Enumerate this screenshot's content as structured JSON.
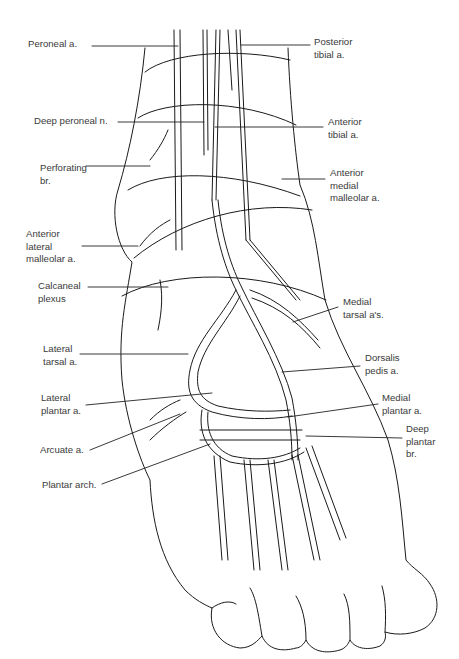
{
  "diagram": {
    "labels_left": [
      {
        "id": "peroneal-a",
        "text": "Peroneal a.",
        "x": 28,
        "y": 38
      },
      {
        "id": "deep-peroneal-n",
        "text": "Deep peroneal n.",
        "x": 34,
        "y": 115
      },
      {
        "id": "perforating-br",
        "text": "Perforating\nbr.",
        "x": 40,
        "y": 162
      },
      {
        "id": "anterior-lateral-malleolar-a",
        "text": "Anterior\nlateral\nmalleolar a.",
        "x": 26,
        "y": 228
      },
      {
        "id": "calcaneal-plexus",
        "text": "Calcaneal\nplexus",
        "x": 38,
        "y": 280
      },
      {
        "id": "lateral-tarsal-a",
        "text": "Lateral\ntarsal a.",
        "x": 43,
        "y": 343
      },
      {
        "id": "lateral-plantar-a",
        "text": "Lateral\nplantar a.",
        "x": 41,
        "y": 392
      },
      {
        "id": "arcuate-a",
        "text": "Arcuate a.",
        "x": 40,
        "y": 444
      },
      {
        "id": "plantar-arch",
        "text": "Plantar arch.",
        "x": 42,
        "y": 479
      }
    ],
    "labels_right": [
      {
        "id": "posterior-tibial-a",
        "text": "Posterior\ntibial a.",
        "x": 314,
        "y": 36
      },
      {
        "id": "anterior-tibial-a",
        "text": "Anterior\ntibial a.",
        "x": 328,
        "y": 116
      },
      {
        "id": "anterior-medial-malleolar-a",
        "text": "Anterior\nmedial\nmalleolar a.",
        "x": 330,
        "y": 167
      },
      {
        "id": "medial-tarsal-as",
        "text": "Medial\ntarsal a's.",
        "x": 343,
        "y": 296
      },
      {
        "id": "dorsalis-pedis-a",
        "text": "Dorsalis\npedis a.",
        "x": 365,
        "y": 352
      },
      {
        "id": "medial-plantar-a",
        "text": "Medial\nplantar a.",
        "x": 382,
        "y": 392
      },
      {
        "id": "deep-plantar-br",
        "text": "Deep\nplantar\nbr.",
        "x": 406,
        "y": 423
      }
    ],
    "leaders": [
      {
        "for": "peroneal-a",
        "x1": 92,
        "y1": 46,
        "x2": 178,
        "y2": 46
      },
      {
        "for": "posterior-tibial-a",
        "x1": 241,
        "y1": 45,
        "x2": 310,
        "y2": 45
      },
      {
        "for": "deep-peroneal-n",
        "x1": 118,
        "y1": 122,
        "x2": 204,
        "y2": 122
      },
      {
        "for": "anterior-tibial-a",
        "x1": 215,
        "y1": 127,
        "x2": 323,
        "y2": 127
      },
      {
        "for": "perforating-br",
        "x1": 86,
        "y1": 166,
        "x2": 150,
        "y2": 166
      },
      {
        "for": "anterior-medial-malleolar-a",
        "x1": 282,
        "y1": 179,
        "x2": 325,
        "y2": 179
      },
      {
        "for": "anterior-lateral-malleolar-a",
        "x1": 82,
        "y1": 246,
        "x2": 138,
        "y2": 246
      },
      {
        "for": "calcaneal-plexus",
        "x1": 88,
        "y1": 287,
        "x2": 168,
        "y2": 287
      },
      {
        "for": "medial-tarsal-as",
        "x1": 293,
        "y1": 322,
        "x2": 338,
        "y2": 307
      },
      {
        "for": "lateral-tarsal-a",
        "x1": 80,
        "y1": 354,
        "x2": 188,
        "y2": 354
      },
      {
        "for": "dorsalis-pedis-a",
        "x1": 282,
        "y1": 372,
        "x2": 360,
        "y2": 366
      },
      {
        "for": "lateral-plantar-a",
        "x1": 86,
        "y1": 405,
        "x2": 212,
        "y2": 393
      },
      {
        "for": "medial-plantar-a",
        "x1": 288,
        "y1": 417,
        "x2": 378,
        "y2": 404
      },
      {
        "for": "deep-plantar-br",
        "x1": 306,
        "y1": 436,
        "x2": 402,
        "y2": 438
      },
      {
        "for": "arcuate-a",
        "x1": 90,
        "y1": 450,
        "x2": 180,
        "y2": 414
      },
      {
        "for": "plantar-arch",
        "x1": 102,
        "y1": 484,
        "x2": 210,
        "y2": 444
      }
    ]
  }
}
